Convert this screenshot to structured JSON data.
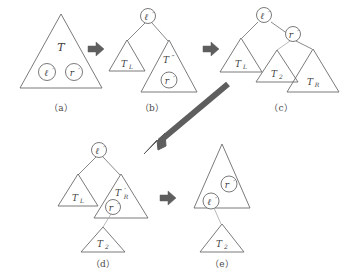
{
  "figure": {
    "title": "",
    "stroke_color": "#6b6b6b",
    "text_color": "#3d3d3d",
    "arrow_color": "#5e5e5e",
    "background": "#ffffff"
  },
  "panels": [
    {
      "id": "a",
      "caption": "（a）",
      "tree_label": "T",
      "nodes": [
        {
          "name": "node-l",
          "label": "ℓ",
          "prime": "′"
        },
        {
          "name": "node-r",
          "label": "r",
          "prime": "′"
        }
      ],
      "triangles": [
        {
          "name": "subtree-T",
          "label": "T",
          "sub": "",
          "prime": ""
        }
      ]
    },
    {
      "id": "b",
      "caption": "（b）",
      "root": {
        "name": "node-l",
        "label": "ℓ",
        "prime": "′"
      },
      "triangles": [
        {
          "name": "subtree-TL",
          "label": "T",
          "sub": "L",
          "prime": ""
        },
        {
          "name": "subtree-Tprime2",
          "label": "T",
          "sub": "",
          "prime": "″"
        }
      ],
      "nodes": [
        {
          "name": "node-r",
          "label": "r",
          "prime": "′"
        }
      ]
    },
    {
      "id": "c",
      "caption": "（c）",
      "root": {
        "name": "node-l",
        "label": "ℓ",
        "prime": "′"
      },
      "child": {
        "name": "node-r",
        "label": "r",
        "prime": "′"
      },
      "triangles": [
        {
          "name": "subtree-TL",
          "label": "T",
          "sub": "L",
          "prime": ""
        },
        {
          "name": "subtree-T2",
          "label": "T",
          "sub": "2",
          "prime": ""
        },
        {
          "name": "subtree-TR",
          "label": "T",
          "sub": "R",
          "prime": ""
        }
      ]
    },
    {
      "id": "d",
      "caption": "（d）",
      "root": {
        "name": "node-l",
        "label": "ℓ",
        "prime": "′"
      },
      "node_r": {
        "name": "node-r",
        "label": "r",
        "prime": "′"
      },
      "triangles": [
        {
          "name": "subtree-TL",
          "label": "T",
          "sub": "L",
          "prime": ""
        },
        {
          "name": "subtree-TRprime",
          "label": "T",
          "sub": "R",
          "prime": "′"
        },
        {
          "name": "subtree-T2",
          "label": "T",
          "sub": "2",
          "prime": ""
        }
      ]
    },
    {
      "id": "e",
      "caption": "（e）",
      "nodes": [
        {
          "name": "node-r",
          "label": "r",
          "prime": "′"
        },
        {
          "name": "node-l",
          "label": "ℓ",
          "prime": "′"
        }
      ],
      "triangles": [
        {
          "name": "subtree-main",
          "label": "",
          "sub": "",
          "prime": ""
        },
        {
          "name": "subtree-T2",
          "label": "T",
          "sub": "2",
          "prime": ""
        }
      ]
    }
  ],
  "arrows": [
    {
      "name": "arrow-a-to-b",
      "direction": "right"
    },
    {
      "name": "arrow-b-to-c",
      "direction": "right"
    },
    {
      "name": "arrow-c-to-d",
      "direction": "down-left"
    },
    {
      "name": "arrow-d-to-e",
      "direction": "right"
    }
  ]
}
